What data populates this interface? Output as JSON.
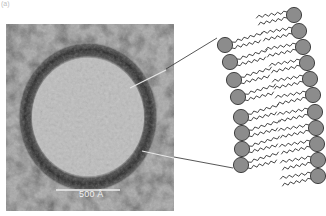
{
  "figure": {
    "panel_label": "(a)",
    "micrograph": {
      "description": "electron micrograph of a lipid vesicle",
      "scale_bar_label": "500 Å",
      "background_color": "#a9a9a9",
      "ring_color": "#2e2e2e",
      "interior_color": "#bcbcbc"
    },
    "diagram": {
      "description": "lipid bilayer schematic with hydrophilic heads and hydrophobic tails",
      "head_color": "#8c8c8c",
      "head_stroke": "#333333",
      "tail_color": "#333333",
      "left_heads": [
        [
          225,
          45
        ],
        [
          230,
          62
        ],
        [
          234,
          80
        ],
        [
          238,
          97
        ],
        [
          241,
          117
        ],
        [
          242,
          133
        ],
        [
          242,
          149
        ],
        [
          241,
          165
        ]
      ],
      "right_heads": [
        [
          294,
          15
        ],
        [
          299,
          31
        ],
        [
          303,
          47
        ],
        [
          307,
          63
        ],
        [
          310,
          79
        ],
        [
          313,
          95
        ],
        [
          315,
          112
        ],
        [
          316,
          128
        ],
        [
          317,
          144
        ],
        [
          318,
          160
        ],
        [
          318,
          176
        ]
      ]
    },
    "connectors": [
      {
        "from": [
          130,
          88
        ],
        "to": [
          217,
          38
        ]
      },
      {
        "from": [
          142,
          151
        ],
        "to": [
          233,
          168
        ]
      }
    ]
  }
}
